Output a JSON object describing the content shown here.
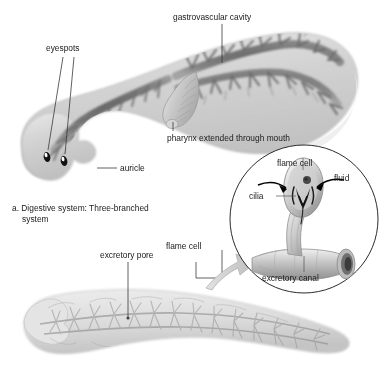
{
  "figure": {
    "background_color": "#ffffff",
    "width": 385,
    "height": 368
  },
  "panel_a": {
    "caption_line1": "a. Digestive system: Three-branched",
    "caption_line2": "system",
    "labels": {
      "eyespots": "eyespots",
      "auricle": "auricle",
      "gastrovascular_cavity": "gastrovascular cavity",
      "pharynx": "pharynx extended through mouth"
    },
    "colors": {
      "body_fill": "#d9d9d9",
      "body_edge": "#b4b4b4",
      "gut_dark": "#6b6b6b",
      "eyespot": "#111111",
      "label_text": "#1a1a1a"
    }
  },
  "panel_b": {
    "labels": {
      "excretory_pore": "excretory pore",
      "flame_cell": "flame cell"
    },
    "colors": {
      "body_fill": "#dedede",
      "tubule": "#9a9a9a"
    }
  },
  "inset": {
    "labels": {
      "flame_cell": "flame cell",
      "fluid": "fluid",
      "cilia": "cilia",
      "excretory_canal": "excretory canal"
    },
    "colors": {
      "circle_stroke": "#2b2b2b",
      "arrow_black": "#000000",
      "arrow_grey": "#c6c6c6",
      "canal_fill": "#c9c9c9"
    }
  },
  "icons": {
    "leader_line": "leader-line",
    "pointer_arrow": "pointer-arrow-icon",
    "callout_arrow": "callout-arrow-icon"
  }
}
